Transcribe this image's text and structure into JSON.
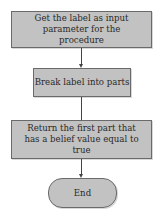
{
  "flowchart": {
    "nodes": [
      {
        "id": "step1",
        "type": "process",
        "label": "Get the label as input parameter for the procedure"
      },
      {
        "id": "step2",
        "type": "process",
        "label": "Break label into parts"
      },
      {
        "id": "step3",
        "type": "process",
        "label": "Return the first part that has a belief value equal to true"
      },
      {
        "id": "end",
        "type": "terminal",
        "label": "End"
      }
    ],
    "edges": [
      {
        "from": "step1",
        "to": "step2"
      },
      {
        "from": "step2",
        "to": "step3"
      },
      {
        "from": "step3",
        "to": "end"
      }
    ],
    "colors": {
      "box_fill": "#c2c2c2",
      "box_border": "#6a6a6a",
      "connector": "#444444"
    }
  }
}
